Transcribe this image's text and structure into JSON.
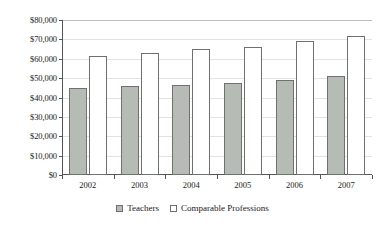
{
  "chart_data": {
    "type": "bar",
    "title": "",
    "subtitle": "",
    "xlabel": "",
    "ylabel": "",
    "categories": [
      "2002",
      "2003",
      "2004",
      "2005",
      "2006",
      "2007"
    ],
    "series": [
      {
        "name": "Teachers",
        "color": "#b6bbb6",
        "values": [
          45000,
          45800,
          46500,
          47500,
          48800,
          51000
        ]
      },
      {
        "name": "Comparable Professions",
        "color": "#ffffff",
        "values": [
          61500,
          63000,
          65000,
          66000,
          69000,
          72000
        ]
      }
    ],
    "ylim": [
      0,
      80000
    ],
    "ytick_values": [
      0,
      10000,
      20000,
      30000,
      40000,
      50000,
      60000,
      70000,
      80000
    ],
    "ytick_labels": [
      "$0",
      "$10,000",
      "$20,000",
      "$30,000",
      "$40,000",
      "$50,000",
      "$60,000",
      "$70,000",
      "$80,000"
    ],
    "grid": true,
    "grid_axis": "y",
    "legend_position": "bottom",
    "legend": [
      "Teachers",
      "Comparable Professions"
    ]
  },
  "axis": {
    "y_labels": [
      "$80,000",
      "$70,000",
      "$60,000",
      "$50,000",
      "$40,000",
      "$30,000",
      "$20,000",
      "$10,000",
      "$0"
    ],
    "x_labels": [
      "2002",
      "2003",
      "2004",
      "2005",
      "2006",
      "2007"
    ]
  },
  "legend": {
    "items": [
      {
        "label": "Teachers"
      },
      {
        "label": "Comparable Professions"
      }
    ]
  }
}
